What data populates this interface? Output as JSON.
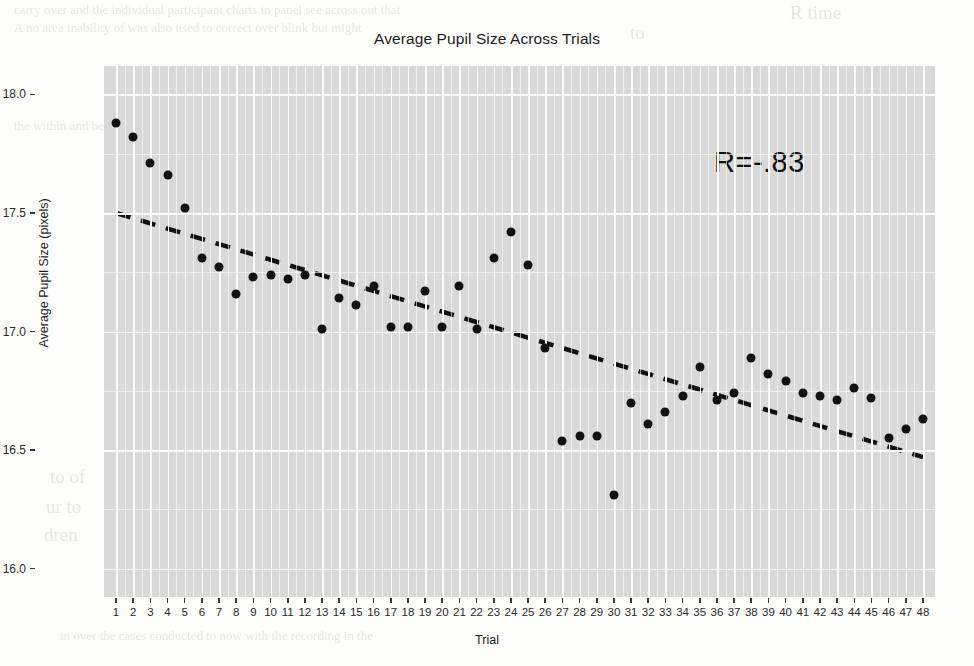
{
  "chart_data": {
    "type": "scatter",
    "title": "Average Pupil Size Across Trials",
    "xlabel": "Trial",
    "ylabel": "Average Pupil Size (pixels)",
    "xlim": [
      0.3,
      48.7
    ],
    "ylim": [
      15.88,
      18.12
    ],
    "yticks": [
      "18.0",
      "17.5",
      "17.0",
      "16.5",
      "16.0"
    ],
    "ytick_values": [
      18.0,
      17.5,
      17.0,
      16.5,
      16.0
    ],
    "xticks": [
      "1",
      "2",
      "3",
      "4",
      "5",
      "6",
      "7",
      "8",
      "9",
      "10",
      "11",
      "12",
      "13",
      "14",
      "15",
      "16",
      "17",
      "18",
      "19",
      "20",
      "21",
      "22",
      "23",
      "24",
      "25",
      "26",
      "27",
      "28",
      "29",
      "30",
      "31",
      "32",
      "33",
      "34",
      "35",
      "36",
      "37",
      "38",
      "39",
      "40",
      "41",
      "42",
      "43",
      "44",
      "45",
      "46",
      "47",
      "48"
    ],
    "grid": true,
    "legend": "none",
    "annotation": "R=-.83",
    "point_color": "#111111",
    "panel_color": "#d9d9d9",
    "grid_color": "#fcfcfc",
    "trendline": {
      "style": "dashed",
      "color": "#111111",
      "x": [
        1,
        48
      ],
      "y": [
        17.5,
        16.47
      ]
    },
    "x": [
      1,
      2,
      3,
      4,
      5,
      6,
      7,
      8,
      9,
      10,
      11,
      12,
      13,
      14,
      15,
      16,
      17,
      18,
      19,
      20,
      21,
      22,
      23,
      24,
      25,
      26,
      27,
      28,
      29,
      30,
      31,
      32,
      33,
      34,
      35,
      36,
      37,
      38,
      39,
      40,
      41,
      42,
      43,
      44,
      45,
      46,
      47,
      48
    ],
    "values": [
      17.88,
      17.82,
      17.71,
      17.66,
      17.52,
      17.31,
      17.27,
      17.16,
      17.23,
      17.24,
      17.22,
      17.24,
      17.01,
      17.14,
      17.11,
      17.19,
      17.02,
      17.02,
      17.17,
      17.02,
      17.19,
      17.01,
      17.31,
      17.42,
      17.28,
      16.93,
      16.54,
      16.56,
      16.56,
      16.31,
      16.7,
      16.61,
      16.66,
      16.73,
      16.85,
      16.71,
      16.74,
      16.89,
      16.82,
      16.79,
      16.74,
      16.73,
      16.71,
      16.76,
      16.72,
      16.55,
      16.59,
      16.63
    ]
  },
  "bleed_text": [
    {
      "t": "carry over and the individual participant charts in panel see across out that",
      "x": 14,
      "y": 2
    },
    {
      "t": "A no area inability of was also used to correct over blink but might",
      "x": 14,
      "y": 20
    },
    {
      "t": "the within and between the individual participants measured task",
      "x": 14,
      "y": 118
    },
    {
      "t": "relevant horizontal",
      "x": 206,
      "y": 228
    },
    {
      "t": "po",
      "x": 206,
      "y": 296
    },
    {
      "t": "condition",
      "x": 200,
      "y": 318
    },
    {
      "t": "to of",
      "x": 50,
      "y": 466
    },
    {
      "t": "ur to",
      "x": 46,
      "y": 496
    },
    {
      "t": "dren",
      "x": 44,
      "y": 524
    },
    {
      "t": "in over the cases conducted to now with the recording in the",
      "x": 60,
      "y": 628
    },
    {
      "t": "ook",
      "x": 110,
      "y": 136
    },
    {
      "t": "R time",
      "x": 790,
      "y": 2
    },
    {
      "t": "to",
      "x": 630,
      "y": 22
    }
  ]
}
